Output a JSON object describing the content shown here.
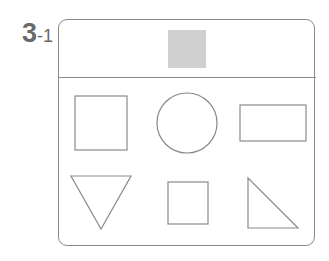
{
  "problem": {
    "number": "3",
    "sub_number": "-1"
  },
  "target_shape": {
    "type": "square",
    "fill": "#d0d0d0"
  },
  "choices": [
    {
      "id": 1,
      "type": "square"
    },
    {
      "id": 2,
      "type": "circle"
    },
    {
      "id": 3,
      "type": "rectangle"
    },
    {
      "id": 4,
      "type": "inverted-triangle"
    },
    {
      "id": 5,
      "type": "small-square"
    },
    {
      "id": 6,
      "type": "right-triangle"
    }
  ],
  "colors": {
    "stroke": "#8a8a8a",
    "label": "#6a6a6a",
    "target_fill": "#d0d0d0"
  }
}
